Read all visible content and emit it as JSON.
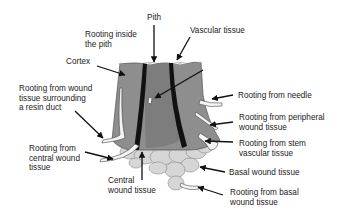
{
  "diagram": {
    "colors": {
      "cortex": "#8c8c8c",
      "pith": "#7a7a7a",
      "vascular": "#111111",
      "wound_tissue": "#d9d9d9",
      "root": "#f2f2f2",
      "arrow": "#111111"
    },
    "labels": {
      "pith": "Pith",
      "rooting_inside_pith": "Rooting inside\nthe pith",
      "vascular_tissue": "Vascular tissue",
      "cortex": "Cortex",
      "rooting_resin_duct": "Rooting from wound\ntissue surrounding\na resin duct",
      "rooting_needle": "Rooting from needle",
      "rooting_peripheral": "Rooting from peripheral\nwound tissue",
      "rooting_stem_vascular": "Rooting from stem\nvascular tissue",
      "rooting_central": "Rooting from\ncentral wound\ntissue",
      "central_wound_tissue": "Central\nwound tissue",
      "basal_wound_tissue": "Basal wound tissue",
      "rooting_basal": "Rooting from basal\nwound tissue"
    }
  }
}
